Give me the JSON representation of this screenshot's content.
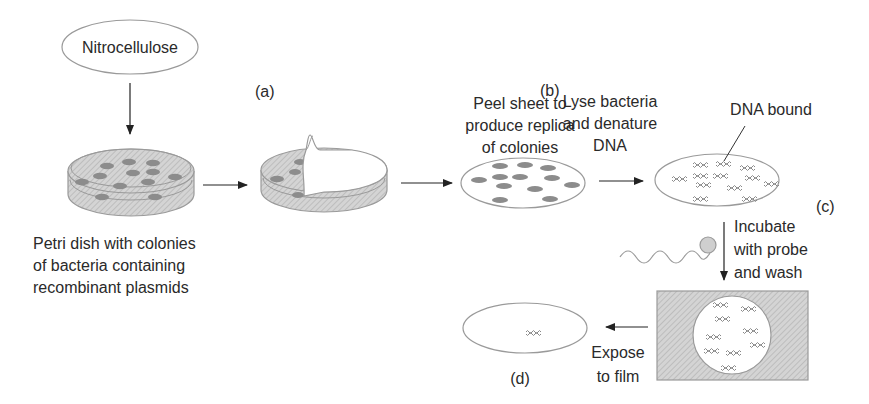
{
  "diagram": {
    "nodes": {
      "nitrocellulose": "Nitrocellulose",
      "petri_caption": [
        "Petri dish with colonies",
        "of bacteria containing",
        "recombinant plasmids"
      ],
      "peel_caption": [
        "Peel sheet to",
        "produce replica",
        "of colonies"
      ],
      "lyse_caption": [
        "Lyse bacteria",
        "and denature",
        "DNA"
      ],
      "dna_bound": "DNA bound",
      "incubate_caption": [
        "Incubate",
        "with probe",
        "and wash"
      ],
      "expose_caption": [
        "Expose",
        "to film"
      ]
    },
    "step_labels": {
      "a": "(a)",
      "b": "(b)",
      "c": "(c)",
      "d": "(d)"
    },
    "colors": {
      "line": "#333333",
      "outline": "#9a9a9a",
      "colony": "#8c8c8c",
      "hatch": "#bdbdbd",
      "background": "#ffffff"
    }
  }
}
